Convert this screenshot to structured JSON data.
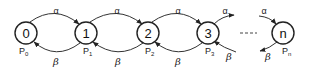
{
  "diagram": {
    "type": "birth-death state transition diagram",
    "nodes": [
      {
        "id": "0",
        "label": "0",
        "prob": "P",
        "prob_sub": "0"
      },
      {
        "id": "1",
        "label": "1",
        "prob": "P",
        "prob_sub": "1"
      },
      {
        "id": "2",
        "label": "2",
        "prob": "P",
        "prob_sub": "2"
      },
      {
        "id": "3",
        "label": "3",
        "prob": "P",
        "prob_sub": "3"
      },
      {
        "id": "n",
        "label": "n",
        "prob": "P",
        "prob_sub": "n"
      }
    ],
    "forward_rate": "α",
    "backward_rate": "β",
    "edges": [
      {
        "from": "0",
        "to": "1",
        "label": "α"
      },
      {
        "from": "1",
        "to": "2",
        "label": "α"
      },
      {
        "from": "2",
        "to": "3",
        "label": "α"
      },
      {
        "from": "3",
        "to": "…",
        "label": "α"
      },
      {
        "from": "…",
        "to": "n",
        "label": "α"
      },
      {
        "from": "1",
        "to": "0",
        "label": "β"
      },
      {
        "from": "2",
        "to": "1",
        "label": "β"
      },
      {
        "from": "3",
        "to": "2",
        "label": "β"
      },
      {
        "from": "…",
        "to": "3",
        "label": "β"
      },
      {
        "from": "n",
        "to": "…",
        "label": "β"
      }
    ],
    "ellipsis": "-----"
  }
}
